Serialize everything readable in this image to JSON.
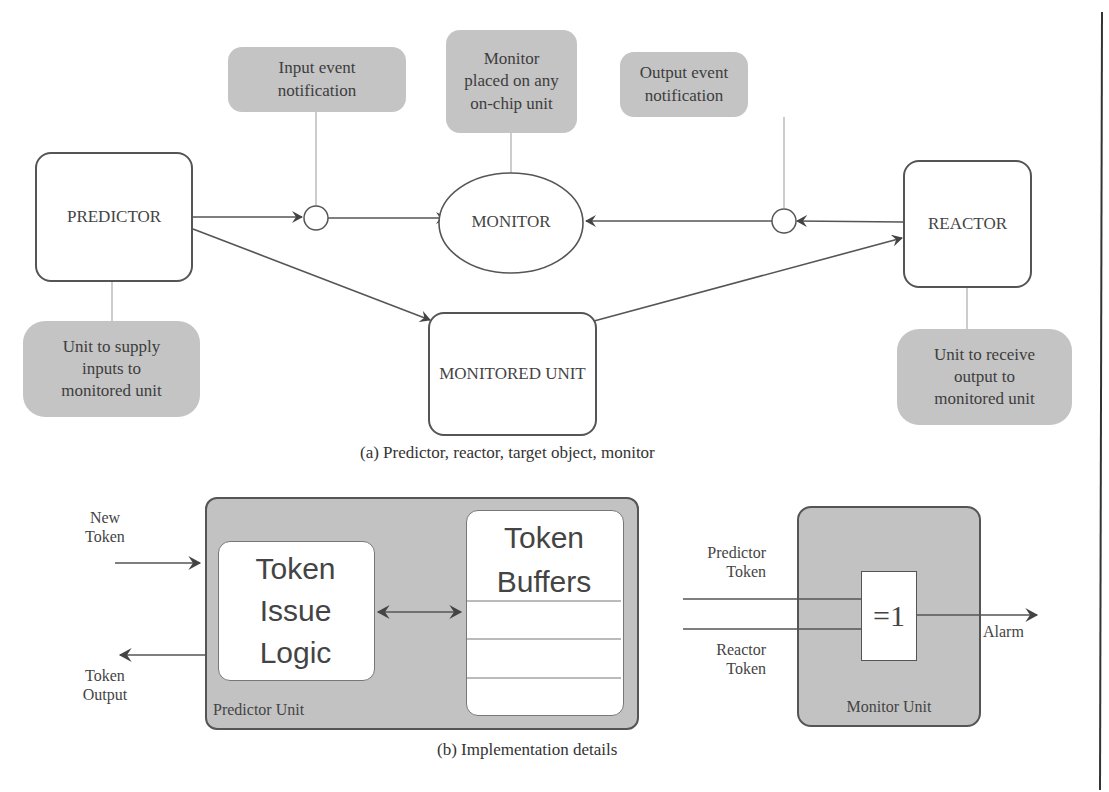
{
  "figure_a": {
    "caption": "(a) Predictor, reactor, target object, monitor",
    "nodes": {
      "predictor": "PREDICTOR",
      "monitor": "MONITOR",
      "reactor": "REACTOR",
      "monitored_unit": "MONITORED UNIT"
    },
    "callouts": {
      "input_event": [
        "Input event",
        "notification"
      ],
      "monitor_placed": [
        "Monitor",
        "placed on any",
        "on-chip unit"
      ],
      "output_event": [
        "Output event",
        "notification"
      ],
      "supply_unit": [
        "Unit to supply",
        "inputs to",
        "monitored unit"
      ],
      "receive_unit": [
        "Unit to receive",
        "output to",
        "monitored unit"
      ]
    }
  },
  "figure_b": {
    "caption": "(b) Implementation details",
    "predictor_unit": {
      "label": "Predictor Unit",
      "new_token": [
        "New",
        "Token"
      ],
      "token_output": [
        "Token",
        "Output"
      ],
      "issue_logic": [
        "Token",
        "Issue",
        "Logic"
      ],
      "buffers": [
        "Token",
        "Buffers"
      ]
    },
    "monitor_unit": {
      "label": "Monitor Unit",
      "gate": "=1",
      "predictor_token": [
        "Predictor",
        "Token"
      ],
      "reactor_token": [
        "Reactor",
        "Token"
      ],
      "alarm": "Alarm"
    }
  },
  "colors": {
    "callout_fill": "#c4c4c4",
    "unit_fill": "#c2c2c2",
    "stroke": "#555555"
  }
}
